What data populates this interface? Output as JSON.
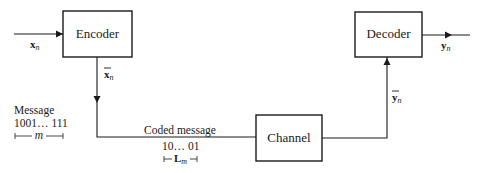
{
  "diagram": {
    "title": "",
    "blocks": {
      "encoder": {
        "label": "Encoder"
      },
      "channel": {
        "label": "Channel"
      },
      "decoder": {
        "label": "Decoder"
      }
    },
    "signals": {
      "input": {
        "base": "x",
        "sub": "n"
      },
      "encoded": {
        "base": "x",
        "sub": "n",
        "overbar": true
      },
      "channel_out": {
        "base": "y",
        "sub": "n",
        "overbar": true
      },
      "output": {
        "base": "y",
        "sub": "n"
      }
    },
    "message": {
      "title": "Message",
      "bits": "1001… 111",
      "length_symbol": "m"
    },
    "coded_message": {
      "title": "Coded message",
      "bits": "10… 01",
      "length_symbol": "L",
      "length_sub": "m"
    },
    "edges": [
      {
        "from": "input",
        "to": "encoder"
      },
      {
        "from": "encoder",
        "to": "channel",
        "label": "x̄n"
      },
      {
        "from": "channel",
        "to": "decoder",
        "label": "ȳn"
      },
      {
        "from": "decoder",
        "to": "output"
      }
    ]
  }
}
